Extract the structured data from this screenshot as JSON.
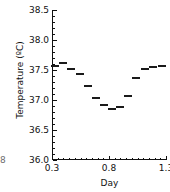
{
  "chart_data": {
    "type": "scatter",
    "marker_style": "horizontal-dash",
    "title": "",
    "xlabel": "Day",
    "ylabel": "Temperature (ºC)",
    "xlim": [
      0.3,
      1.3
    ],
    "ylim": [
      36.0,
      38.5
    ],
    "grid": false,
    "legend": null,
    "xticks": [
      0.3,
      0.8,
      1.3
    ],
    "xtick_labels": [
      "0.3",
      "0.8",
      "1.3"
    ],
    "xminor_tick_count": 9,
    "yticks": [
      36.0,
      36.5,
      37.0,
      37.5,
      38.0,
      38.5
    ],
    "ytick_labels": [
      "36.0",
      "36.5",
      "37.0",
      "37.5",
      "38.0",
      "38.5"
    ],
    "yminor_tick_count": 4,
    "x": [
      0.33,
      0.4,
      0.47,
      0.545,
      0.615,
      0.685,
      0.755,
      0.825,
      0.895,
      0.965,
      1.035,
      1.115,
      1.19,
      1.265
    ],
    "y": [
      37.56,
      37.61,
      37.52,
      37.44,
      37.23,
      37.03,
      36.92,
      36.85,
      36.88,
      37.07,
      37.37,
      37.52,
      37.55,
      37.56
    ],
    "series": [
      {
        "name": "Temperature",
        "values": [
          37.56,
          37.61,
          37.52,
          37.44,
          37.23,
          37.03,
          36.92,
          36.85,
          36.88,
          37.07,
          37.37,
          37.52,
          37.55,
          37.56
        ]
      }
    ],
    "colors": {
      "marker": "#1a1a1a",
      "axis": "#111111",
      "background": "#ffffff"
    }
  },
  "annotations": {
    "stray_glyph": "8"
  }
}
